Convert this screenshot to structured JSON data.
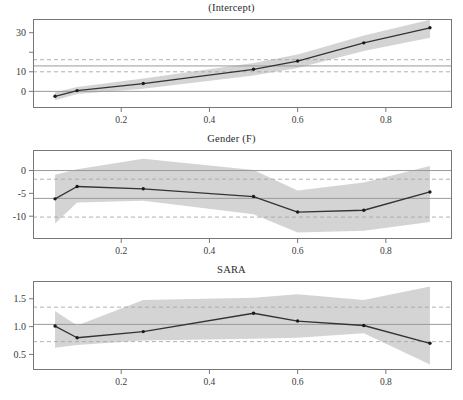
{
  "figure": {
    "kind": "quantile-regression-coefficient-panels",
    "panel_count": 3,
    "width": 463,
    "height": 400,
    "background": "#ffffff",
    "band_color": "#d0d0d0",
    "line_color": "#333333",
    "point_color": "#1a1a1a",
    "ols_line_color": "#999999",
    "ols_ci_color": "#a8a8a8",
    "frame_color": "#777777"
  },
  "chart_data": [
    {
      "type": "line",
      "title": "(Intercept)",
      "xlabel": "",
      "ylabel": "",
      "grid": false,
      "legend": "none",
      "xlim": [
        0.0,
        0.95
      ],
      "ylim": [
        -8.5,
        37.0
      ],
      "xticks": [
        0.2,
        0.4,
        0.6,
        0.8
      ],
      "xtick_labels": [
        "0.2",
        "0.4",
        "0.6",
        "0.8"
      ],
      "yticks": [
        0,
        10,
        20,
        30
      ],
      "ytick_labels": [
        "0",
        "10",
        "",
        "30"
      ],
      "x": [
        0.05,
        0.1,
        0.25,
        0.5,
        0.6,
        0.75,
        0.9
      ],
      "values": [
        -2.5,
        0.4,
        4.0,
        11.3,
        15.5,
        24.8,
        32.5
      ],
      "band_lower": [
        -4.6,
        -1.4,
        1.4,
        8.1,
        12.0,
        20.6,
        27.4
      ],
      "band_upper": [
        -0.4,
        2.2,
        6.6,
        14.5,
        18.8,
        28.6,
        36.6
      ],
      "reference_lines": [
        {
          "name": "ols-estimate",
          "value": 13.0,
          "style": "solid"
        },
        {
          "name": "ols-ci-upper",
          "value": 16.2,
          "style": "dashed"
        },
        {
          "name": "ols-ci-lower",
          "value": 10.0,
          "style": "dashed"
        },
        {
          "name": "zero-line",
          "value": 0.0,
          "style": "solid"
        }
      ]
    },
    {
      "type": "line",
      "title": "Gender (F)",
      "xlabel": "",
      "ylabel": "",
      "grid": false,
      "legend": "none",
      "xlim": [
        0.0,
        0.95
      ],
      "ylim": [
        -15.0,
        4.5
      ],
      "xticks": [
        0.2,
        0.4,
        0.6,
        0.8
      ],
      "xtick_labels": [
        "0.2",
        "0.4",
        "0.6",
        "0.8"
      ],
      "yticks": [
        0,
        -5,
        -10
      ],
      "ytick_labels": [
        "0",
        "-5",
        "-10"
      ],
      "x": [
        0.05,
        0.1,
        0.25,
        0.5,
        0.6,
        0.75,
        0.9
      ],
      "values": [
        -6.2,
        -3.5,
        -4.0,
        -5.7,
        -9.1,
        -8.7,
        -4.7
      ],
      "band_lower": [
        -11.6,
        -7.0,
        -6.6,
        -9.6,
        -13.6,
        -13.2,
        -11.3
      ],
      "band_upper": [
        -0.9,
        0.3,
        2.6,
        0.1,
        -4.4,
        -2.6,
        1.0
      ],
      "reference_lines": [
        {
          "name": "ols-estimate",
          "value": -6.1,
          "style": "solid"
        },
        {
          "name": "ols-ci-upper",
          "value": -1.9,
          "style": "dashed"
        },
        {
          "name": "ols-ci-lower",
          "value": -10.2,
          "style": "dashed"
        },
        {
          "name": "zero-line",
          "value": 0.0,
          "style": "solid"
        }
      ]
    },
    {
      "type": "line",
      "title": "SARA",
      "xlabel": "",
      "ylabel": "",
      "grid": false,
      "legend": "none",
      "xlim": [
        0.0,
        0.95
      ],
      "ylim": [
        0.22,
        1.82
      ],
      "xticks": [
        0.2,
        0.4,
        0.6,
        0.8
      ],
      "xtick_labels": [
        "0.2",
        "0.4",
        "0.6",
        "0.8"
      ],
      "yticks": [
        0.5,
        1.0,
        1.5
      ],
      "ytick_labels": [
        "0.5",
        "1.0",
        "1.5"
      ],
      "x": [
        0.05,
        0.1,
        0.25,
        0.5,
        0.6,
        0.75,
        0.9
      ],
      "values": [
        1.01,
        0.8,
        0.91,
        1.24,
        1.1,
        1.02,
        0.7
      ],
      "band_lower": [
        0.62,
        0.67,
        0.75,
        0.78,
        0.8,
        0.88,
        0.32
      ],
      "band_upper": [
        1.28,
        1.02,
        1.48,
        1.52,
        1.58,
        1.48,
        1.72
      ],
      "reference_lines": [
        {
          "name": "ols-estimate",
          "value": 1.04,
          "style": "solid"
        },
        {
          "name": "ols-ci-upper",
          "value": 1.35,
          "style": "dashed"
        },
        {
          "name": "ols-ci-lower",
          "value": 0.73,
          "style": "dashed"
        }
      ]
    }
  ]
}
